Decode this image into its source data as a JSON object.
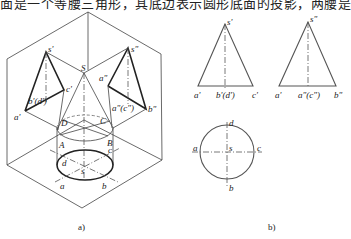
{
  "header_text": "面是一个等腰三角形，其底边表示圆形底面的投影，两腰是",
  "figure_a": {
    "caption": "a)",
    "labels": {
      "s_prime": "s'",
      "c_prime": "c'",
      "a_prime": "a'",
      "bd_prime": "b'(d')",
      "S": "S",
      "s_dprime": "s\"",
      "a_dprime": "a\"",
      "ac_dprime": "a\"(c\")",
      "b_dprime": "b\"",
      "D": "D",
      "C": "C",
      "A": "A",
      "B": "B",
      "c": "c",
      "d": "d",
      "s": "s",
      "a": "a",
      "b": "b"
    }
  },
  "figure_b": {
    "caption": "b)",
    "front_view": {
      "apex": "s'",
      "base_left": "a'",
      "base_mid": "b'(d')",
      "base_right": "c'"
    },
    "side_view": {
      "apex": "s\"",
      "base_left": "a'",
      "base_mid": "a\"(c\")",
      "base_right": "b\""
    },
    "top_view": {
      "top": "d",
      "left": "a",
      "center": "s",
      "right": "c",
      "bottom": "b"
    }
  }
}
